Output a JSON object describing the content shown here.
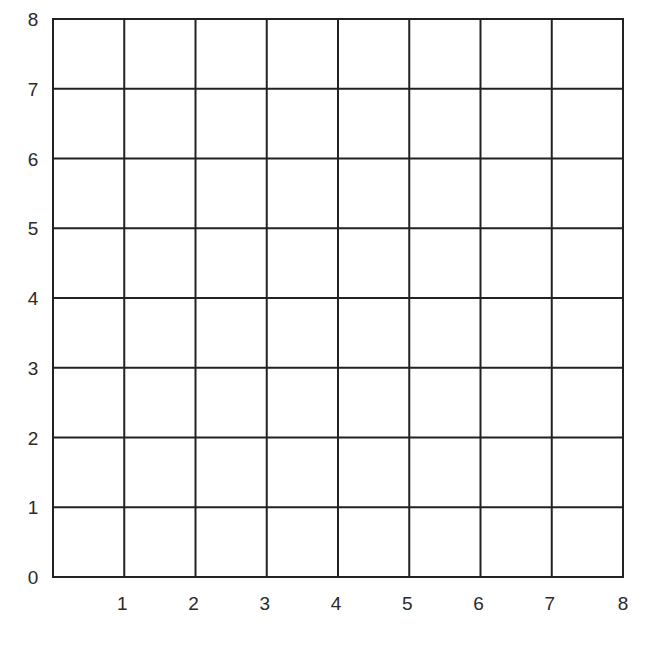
{
  "grid": {
    "x_min": 0,
    "x_max": 8,
    "y_min": 0,
    "y_max": 8,
    "x_ticks": [
      "1",
      "2",
      "3",
      "4",
      "5",
      "6",
      "7",
      "8"
    ],
    "y_ticks": [
      "0",
      "1",
      "2",
      "3",
      "4",
      "5",
      "6",
      "7",
      "8"
    ],
    "line_color": "#222222",
    "background": "#ffffff"
  },
  "chart_data": {
    "type": "grid",
    "title": "",
    "xlabel": "",
    "ylabel": "",
    "xlim": [
      0,
      8
    ],
    "ylim": [
      0,
      8
    ],
    "x_tick_labels": [
      "1",
      "2",
      "3",
      "4",
      "5",
      "6",
      "7",
      "8"
    ],
    "y_tick_labels": [
      "0",
      "1",
      "2",
      "3",
      "4",
      "5",
      "6",
      "7",
      "8"
    ],
    "grid": true,
    "series": []
  }
}
